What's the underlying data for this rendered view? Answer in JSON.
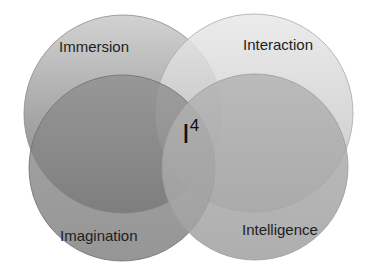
{
  "diagram": {
    "type": "venn",
    "center_label": {
      "base": "I",
      "superscript": "4"
    },
    "circles": [
      {
        "id": "immersion",
        "label": "Immersion",
        "cx": 123,
        "cy": 114,
        "r": 99,
        "color_top": "#d2d2d2",
        "color_bottom": "#7e7e7e"
      },
      {
        "id": "interaction",
        "label": "Interaction",
        "cx": 254,
        "cy": 113,
        "r": 99,
        "color_top": "#e6e6e6",
        "color_bottom": "#bdbdbd"
      },
      {
        "id": "imagination",
        "label": "Imagination",
        "cx": 122,
        "cy": 168,
        "r": 93,
        "color_top": "#8c8c8c",
        "color_bottom": "#7a7a7a"
      },
      {
        "id": "intelligence",
        "label": "Intelligence",
        "cx": 255,
        "cy": 167,
        "r": 93,
        "color_top": "#b0b0b0",
        "color_bottom": "#a2a2a2"
      }
    ]
  }
}
